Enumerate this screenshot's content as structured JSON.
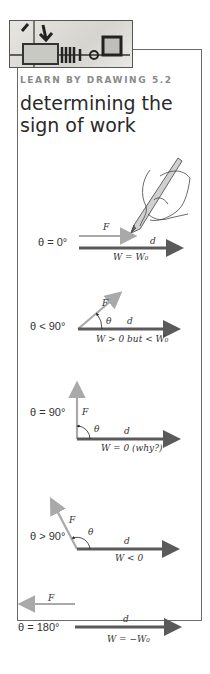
{
  "header": {
    "kicker": "LEARN BY DRAWING 5.2",
    "title": "determining the sign of work"
  },
  "diagrams": [
    {
      "theta": "θ = 0°",
      "force_label": "F",
      "disp_label": "d",
      "work": "W = W₀"
    },
    {
      "theta": "θ < 90°",
      "force_label": "F",
      "angle_label": "θ",
      "disp_label": "d",
      "work": "W > 0 but < W₀"
    },
    {
      "theta": "θ = 90°",
      "force_label": "F",
      "angle_label": "θ",
      "disp_label": "d",
      "work": "W = 0  (why?)"
    },
    {
      "theta": "θ > 90°",
      "force_label": "F",
      "angle_label": "θ",
      "disp_label": "d",
      "work": "W < 0"
    },
    {
      "theta": "θ = 180°",
      "force_label": "F",
      "disp_label": "d",
      "work": "W = −W₀"
    }
  ],
  "colors": {
    "force_arrow": "#a9a9a9",
    "displacement_arrow": "#5a5a5a",
    "border": "#6b6b6b",
    "kicker": "#8a8a8a",
    "title": "#2a2a2a"
  }
}
